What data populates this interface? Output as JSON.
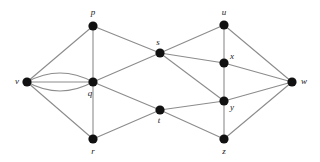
{
  "figure": {
    "background_color": "#ffffff",
    "edge_color": "#8c8c8c",
    "node_color": "#111111",
    "label_color": "#1a1a1a"
  },
  "chart_data": {
    "type": "diagram",
    "title": "",
    "nodes": [
      {
        "id": "v",
        "label": "v",
        "x": 27,
        "y": 82,
        "label_x": 17,
        "label_y": 82,
        "label_anchor": "middle"
      },
      {
        "id": "p",
        "label": "p",
        "x": 93,
        "y": 26,
        "label_x": 93,
        "label_y": 13,
        "label_anchor": "middle"
      },
      {
        "id": "q",
        "label": "q",
        "x": 93,
        "y": 82,
        "label_x": 90,
        "label_y": 94,
        "label_anchor": "middle"
      },
      {
        "id": "r",
        "label": "r",
        "x": 93,
        "y": 139,
        "label_x": 93,
        "label_y": 152,
        "label_anchor": "middle"
      },
      {
        "id": "s",
        "label": "s",
        "x": 160,
        "y": 53,
        "label_x": 158,
        "label_y": 43,
        "label_anchor": "middle"
      },
      {
        "id": "t",
        "label": "t",
        "x": 160,
        "y": 110,
        "label_x": 159,
        "label_y": 121,
        "label_anchor": "middle"
      },
      {
        "id": "u",
        "label": "u",
        "x": 224,
        "y": 25,
        "label_x": 224,
        "label_y": 13,
        "label_anchor": "middle"
      },
      {
        "id": "x",
        "label": "x",
        "x": 224,
        "y": 63,
        "label_x": 232,
        "label_y": 57,
        "label_anchor": "middle"
      },
      {
        "id": "y",
        "label": "y",
        "x": 224,
        "y": 101,
        "label_x": 232,
        "label_y": 108,
        "label_anchor": "middle"
      },
      {
        "id": "z",
        "label": "z",
        "x": 224,
        "y": 139,
        "label_x": 224,
        "label_y": 152,
        "label_anchor": "middle"
      },
      {
        "id": "w",
        "label": "w",
        "x": 292,
        "y": 82,
        "label_x": 304,
        "label_y": 82,
        "label_anchor": "middle"
      }
    ],
    "edges": [
      {
        "from": "v",
        "to": "p",
        "curve": 0
      },
      {
        "from": "v",
        "to": "q",
        "curve": -9
      },
      {
        "from": "v",
        "to": "q",
        "curve": 0
      },
      {
        "from": "v",
        "to": "q",
        "curve": 9
      },
      {
        "from": "v",
        "to": "r",
        "curve": 0
      },
      {
        "from": "p",
        "to": "q",
        "curve": 0
      },
      {
        "from": "p",
        "to": "s",
        "curve": 0
      },
      {
        "from": "q",
        "to": "r",
        "curve": 0
      },
      {
        "from": "q",
        "to": "s",
        "curve": 0
      },
      {
        "from": "q",
        "to": "t",
        "curve": 0
      },
      {
        "from": "r",
        "to": "t",
        "curve": 0
      },
      {
        "from": "s",
        "to": "u",
        "curve": 0
      },
      {
        "from": "s",
        "to": "x",
        "curve": 0
      },
      {
        "from": "s",
        "to": "y",
        "curve": 0
      },
      {
        "from": "t",
        "to": "y",
        "curve": 0
      },
      {
        "from": "t",
        "to": "z",
        "curve": 0
      },
      {
        "from": "u",
        "to": "x",
        "curve": 0
      },
      {
        "from": "u",
        "to": "w",
        "curve": 0
      },
      {
        "from": "x",
        "to": "y",
        "curve": 0
      },
      {
        "from": "x",
        "to": "w",
        "curve": 0
      },
      {
        "from": "y",
        "to": "z",
        "curve": 0
      },
      {
        "from": "y",
        "to": "w",
        "curve": 0
      },
      {
        "from": "z",
        "to": "w",
        "curve": 0
      }
    ],
    "node_radius": 4.6,
    "edge_count": 23,
    "node_count": 11,
    "multi_edges": "v-q has 3 parallel edges"
  }
}
